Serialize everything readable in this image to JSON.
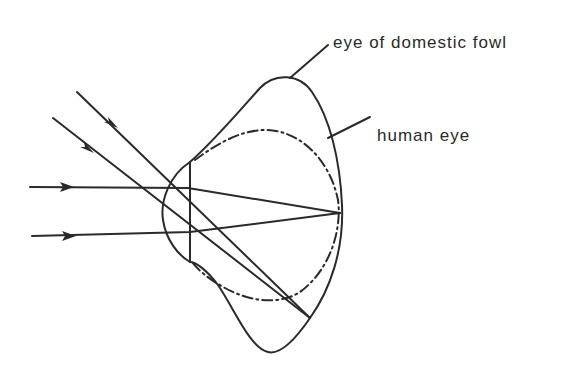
{
  "diagram": {
    "labels": {
      "fowl": "eye of domestic fowl",
      "human": "human eye"
    },
    "colors": {
      "ink": "#2a2a2a",
      "background": "#ffffff"
    },
    "elements": [
      {
        "name": "fowl-eye-outline",
        "style": "solid"
      },
      {
        "name": "human-eye-outline",
        "style": "dash-dot"
      },
      {
        "name": "lens",
        "style": "solid"
      },
      {
        "name": "parallel-horizontal-rays",
        "count": 2,
        "focus": "retina"
      },
      {
        "name": "parallel-oblique-rays",
        "count": 2,
        "focus": "lower retina"
      }
    ]
  }
}
